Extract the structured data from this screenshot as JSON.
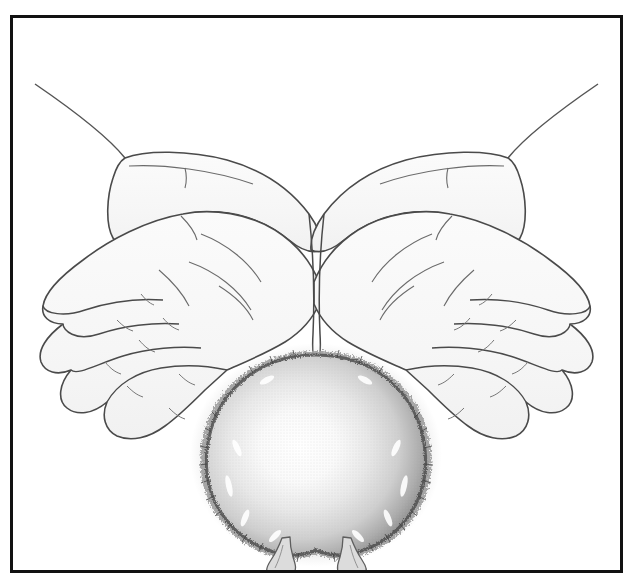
{
  "image": {
    "kind": "line-art-illustration",
    "title": "Cupped hands holding a small round furry chick",
    "background_color": "#ffffff",
    "frame": {
      "name": "illustration-frame",
      "border_color": "#111111",
      "border_width_px": 3,
      "left_px": 10,
      "top_px": 15,
      "width_px": 613,
      "height_px": 558,
      "fill_color": "#ffffff"
    },
    "palette": {
      "outline": "#3a3a3a",
      "outline_strong": "#2b2b2b",
      "skin_fill": "#f7f7f7",
      "skin_shade": "#ededed",
      "fur_light": "#fbfbfb",
      "fur_mid": "#d8d8d8",
      "fur_dark": "#9a9a9a",
      "fur_edge": "#6e6e6e",
      "foot_fill": "#dcdcdc",
      "foot_outline": "#5a5a5a",
      "halftone": "#c9c9c9"
    },
    "subjects": [
      {
        "name": "left-hand",
        "description": "Open left hand, palm up, seen from above, four fingers splayed toward lower-left, wrist exiting at upper-left corner"
      },
      {
        "name": "right-hand",
        "description": "Open right hand, palm up, mirrored, four fingers splayed toward lower-right, wrist exiting at upper-right corner"
      },
      {
        "name": "chick",
        "description": "Round downy chick seen from above, shaded sphere with fuzzy fur silhouette, highlight at center, resting in the cradle of both palms"
      },
      {
        "name": "chick-feet",
        "description": "Two small pale legs and feet protruding below the body"
      }
    ],
    "counts": {
      "hands": 2,
      "fingers_per_hand": 4,
      "thumbs_visible": 2,
      "chick_feet": 2
    }
  }
}
